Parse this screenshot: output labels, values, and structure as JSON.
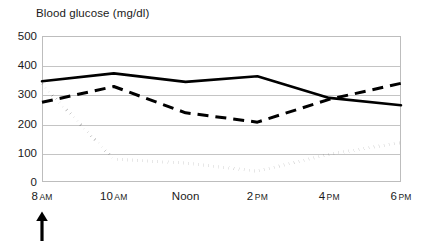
{
  "chart_data": {
    "type": "line",
    "title": "Blood glucose (mg/dl)",
    "xlabel": "",
    "ylabel": "",
    "ylim": [
      0,
      500
    ],
    "ytick_values": [
      500,
      400,
      300,
      200,
      100,
      0
    ],
    "ytick_labels": [
      "500",
      "400",
      "300",
      "200",
      "100",
      "0"
    ],
    "grid": true,
    "legend": "none",
    "categories": [
      "8 AM",
      "10 AM",
      "Noon",
      "2 PM",
      "4 PM",
      "6 PM"
    ],
    "x_tick_parts": [
      {
        "hour": "8",
        "meridiem": "AM"
      },
      {
        "hour": "10",
        "meridiem": "AM"
      },
      {
        "hour": "Noon",
        "meridiem": ""
      },
      {
        "hour": "2",
        "meridiem": "PM"
      },
      {
        "hour": "4",
        "meridiem": "PM"
      },
      {
        "hour": "6",
        "meridiem": "PM"
      }
    ],
    "x_values": [
      8,
      10,
      12,
      14,
      16,
      18
    ],
    "series": [
      {
        "name": "solid-line",
        "style": "solid",
        "color": "#000000",
        "values": [
          345,
          372,
          343,
          362,
          288,
          263
        ]
      },
      {
        "name": "dashed-line",
        "style": "dashed",
        "color": "#000000",
        "values": [
          273,
          327,
          237,
          205,
          283,
          338
        ]
      },
      {
        "name": "dotted-line",
        "style": "dotted",
        "color": "#000000",
        "values": [
          335,
          78,
          65,
          37,
          95,
          135
        ]
      }
    ],
    "annotations": [
      {
        "name": "up-arrow-at-8am",
        "glyph": "arrow-up",
        "at_category": "8 AM",
        "color": "#000000"
      }
    ]
  },
  "colors": {
    "background": "#ffffff",
    "gridline": "#c4c4c4",
    "frame": "#bdbdbd",
    "text": "#1a1a1a",
    "series": "#000000"
  }
}
